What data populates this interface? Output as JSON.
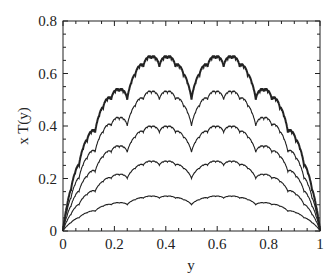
{
  "chart_data": {
    "type": "line",
    "title": "",
    "xlabel": "y",
    "ylabel": "x T(y)",
    "xlim": [
      0,
      1
    ],
    "ylim": [
      0,
      0.8
    ],
    "xticks": [
      "0",
      "0.2",
      "0.4",
      "0.6",
      "0.8",
      "1"
    ],
    "yticks": [
      "0",
      "0.2",
      "0.4",
      "0.6",
      "0.8"
    ],
    "grid": false,
    "legend": null,
    "series": [
      {
        "name": "x=0.2",
        "scale": 0.2,
        "max": 0.133,
        "bold": false
      },
      {
        "name": "x=0.4",
        "scale": 0.4,
        "max": 0.267,
        "bold": false
      },
      {
        "name": "x=0.6",
        "scale": 0.6,
        "max": 0.4,
        "bold": false
      },
      {
        "name": "x=0.8",
        "scale": 0.8,
        "max": 0.533,
        "bold": false
      },
      {
        "name": "x=1.0",
        "scale": 1.0,
        "max": 0.667,
        "bold": true
      }
    ]
  }
}
